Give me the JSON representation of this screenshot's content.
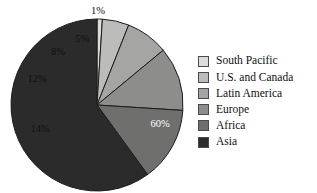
{
  "chart_data": {
    "type": "pie",
    "title": "",
    "categories": [
      "South Pacific",
      "U.S. and Canada",
      "Latin America",
      "Europe",
      "Africa",
      "Asia"
    ],
    "values": [
      1,
      5,
      8,
      12,
      14,
      60
    ],
    "value_labels": [
      "1%",
      "5%",
      "8%",
      "12%",
      "14%",
      "60%"
    ],
    "units": "percent",
    "start_angle_deg": 0,
    "direction": "clockwise",
    "legend_position": "right",
    "grid": false,
    "colors": [
      "#dcdcda",
      "#bcbcba",
      "#a5a5a3",
      "#8d8d8b",
      "#6f6f6d",
      "#2b2b2b"
    ],
    "label_text_colors": [
      "#111111",
      "#111111",
      "#111111",
      "#111111",
      "#111111",
      "#ffffff"
    ],
    "slices": [
      {
        "label": "South Pacific",
        "value": 1,
        "display": "1%",
        "color": "#dcdcda",
        "label_color": "#111111"
      },
      {
        "label": "U.S. and Canada",
        "value": 5,
        "display": "5%",
        "color": "#bcbcba",
        "label_color": "#111111"
      },
      {
        "label": "Latin America",
        "value": 8,
        "display": "8%",
        "color": "#a5a5a3",
        "label_color": "#111111"
      },
      {
        "label": "Europe",
        "value": 12,
        "display": "12%",
        "color": "#8d8d8b",
        "label_color": "#111111"
      },
      {
        "label": "Africa",
        "value": 14,
        "display": "14%",
        "color": "#6f6f6d",
        "label_color": "#111111"
      },
      {
        "label": "Asia",
        "value": 60,
        "display": "60%",
        "color": "#2b2b2b",
        "label_color": "#ffffff"
      }
    ]
  },
  "pie": {
    "center_x": 97,
    "center_y": 105,
    "radius": 86,
    "outline_color": "#1d1d1d",
    "label_positions": [
      {
        "display": "1%",
        "x": 98,
        "y": 12
      },
      {
        "display": "5%",
        "x": 82,
        "y": 40
      },
      {
        "display": "8%",
        "x": 58,
        "y": 53
      },
      {
        "display": "12%",
        "x": 37,
        "y": 80
      },
      {
        "display": "14%",
        "x": 40,
        "y": 130
      },
      {
        "display": "60%",
        "x": 160,
        "y": 125
      }
    ]
  },
  "legend": {
    "items": [
      {
        "label": "South Pacific",
        "color": "#dcdcda"
      },
      {
        "label": "U.S. and Canada",
        "color": "#bcbcba"
      },
      {
        "label": "Latin America",
        "color": "#a5a5a3"
      },
      {
        "label": "Europe",
        "color": "#8d8d8b"
      },
      {
        "label": "Africa",
        "color": "#6f6f6d"
      },
      {
        "label": "Asia",
        "color": "#2b2b2b"
      }
    ]
  }
}
